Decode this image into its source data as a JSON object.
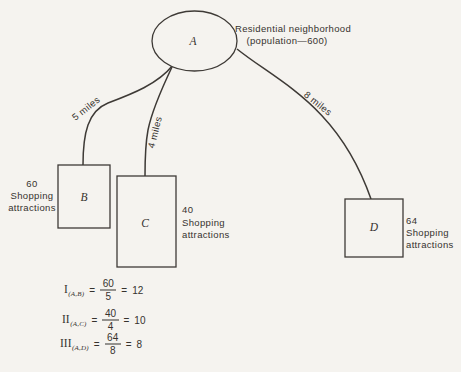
{
  "palette": {
    "background": "#f5f3ef",
    "ink": "#35322e",
    "line": "#3e3a36"
  },
  "origin": {
    "label": "A",
    "caption_line1": "Residential neighborhood",
    "caption_line2": "(population—600)"
  },
  "destinations": [
    {
      "label": "B",
      "distance_label": "5 miles",
      "attractions_value": "60",
      "attractions_word1": "Shopping",
      "attractions_word2": "attractions"
    },
    {
      "label": "C",
      "distance_label": "4 miles",
      "attractions_value": "40",
      "attractions_word1": "Shopping",
      "attractions_word2": "attractions"
    },
    {
      "label": "D",
      "distance_label": "8 miles",
      "attractions_value": "64",
      "attractions_word1": "Shopping",
      "attractions_word2": "attractions"
    }
  ],
  "equals_sign": "=",
  "formulas": [
    {
      "numeral": "I",
      "subscript": "(A,B)",
      "numerator": "60",
      "denominator": "5",
      "result": "12"
    },
    {
      "numeral": "II",
      "subscript": "(A,C)",
      "numerator": "40",
      "denominator": "4",
      "result": "10"
    },
    {
      "numeral": "III",
      "subscript": "(A,D)",
      "numerator": "64",
      "denominator": "8",
      "result": "8"
    }
  ]
}
